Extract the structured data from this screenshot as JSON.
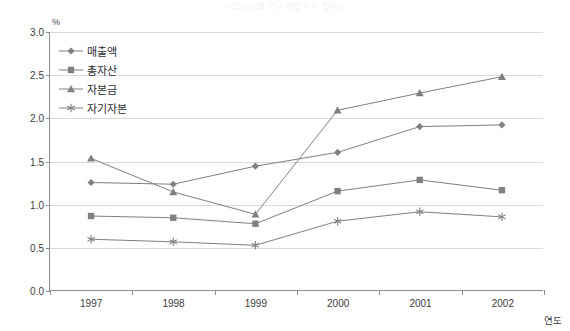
{
  "title": "기업규모별 연구개발투자 집약도",
  "unit_label": "%",
  "xaxis_title": "연도",
  "legend": {
    "items": [
      {
        "label": "매출액",
        "marker": "diamond",
        "color": "#808080"
      },
      {
        "label": "총자산",
        "marker": "square",
        "color": "#808080"
      },
      {
        "label": "자본금",
        "marker": "triangle",
        "color": "#808080"
      },
      {
        "label": "자기자본",
        "marker": "asterisk",
        "color": "#808080"
      }
    ]
  },
  "chart_data": {
    "type": "line",
    "title": "기업규모별 연구개발투자 집약도",
    "xlabel": "연도",
    "ylabel": "%",
    "categories": [
      "1997",
      "1998",
      "1999",
      "2000",
      "2001",
      "2002"
    ],
    "ylim": [
      0.0,
      3.0
    ],
    "ytick_labels": [
      "0.0",
      "0.5",
      "1.0",
      "1.5",
      "2.0",
      "2.5",
      "3.0"
    ],
    "ytick_values": [
      0.0,
      0.5,
      1.0,
      1.5,
      2.0,
      2.5,
      3.0
    ],
    "grid": true,
    "legend_position": "upper-left-inside",
    "series": [
      {
        "name": "매출액",
        "marker": "diamond",
        "color": "#808080",
        "values": [
          1.25,
          1.23,
          1.44,
          1.6,
          1.9,
          1.92
        ]
      },
      {
        "name": "총자산",
        "marker": "square",
        "color": "#808080",
        "values": [
          0.86,
          0.84,
          0.77,
          1.15,
          1.28,
          1.16
        ]
      },
      {
        "name": "자본금",
        "marker": "triangle",
        "color": "#808080",
        "values": [
          1.53,
          1.14,
          0.88,
          2.09,
          2.29,
          2.48
        ]
      },
      {
        "name": "자기자본",
        "marker": "asterisk",
        "color": "#808080",
        "values": [
          0.59,
          0.56,
          0.52,
          0.8,
          0.91,
          0.85
        ]
      }
    ]
  }
}
